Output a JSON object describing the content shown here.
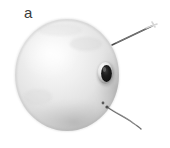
{
  "figure": {
    "panel_label": "a",
    "caption_text": "",
    "background_color": "#ffffff",
    "width_px": 170,
    "height_px": 148
  },
  "specimen": {
    "name": "sphere",
    "description": "matte light-grey spherical shell",
    "body_color_light": "#f2f2f2",
    "body_color_mid": "#dcdcdc",
    "body_color_shadow": "#b9b9b9",
    "edge_color": "#a8a8a8",
    "center_x": 67,
    "center_y": 75,
    "radius_x": 52,
    "radius_y": 56,
    "highlight_x": 49,
    "highlight_y": 54
  },
  "aperture": {
    "name": "bore-hole",
    "description": "dark elliptical opening with raised pale rim",
    "center_x": 106,
    "center_y": 73,
    "radius_x": 6,
    "radius_y": 9,
    "fill_color": "#1f1f1f",
    "rim_color": "#fbfbfb",
    "rim_shadow_color": "#8f8f8f"
  },
  "surface_mark": {
    "name": "surface-speck",
    "center_x": 103,
    "center_y": 103,
    "radius": 1.4,
    "color": "#5a5a5a"
  },
  "wires": [
    {
      "name": "upper-wire",
      "color": "#4a4a4a",
      "stroke_width": 1.5,
      "path": "M112,45 L152,26",
      "tip_color": "#e8e8e8",
      "tip_x": 152,
      "tip_y": 26
    },
    {
      "name": "lower-wire",
      "color": "#6d6d6d",
      "stroke_width": 1.4,
      "path": "M107,107 C118,115 126,118 134,124 C137,126 139,128 141,129",
      "tip_color": "#cfcfcf",
      "tip_x": 141,
      "tip_y": 129
    }
  ]
}
